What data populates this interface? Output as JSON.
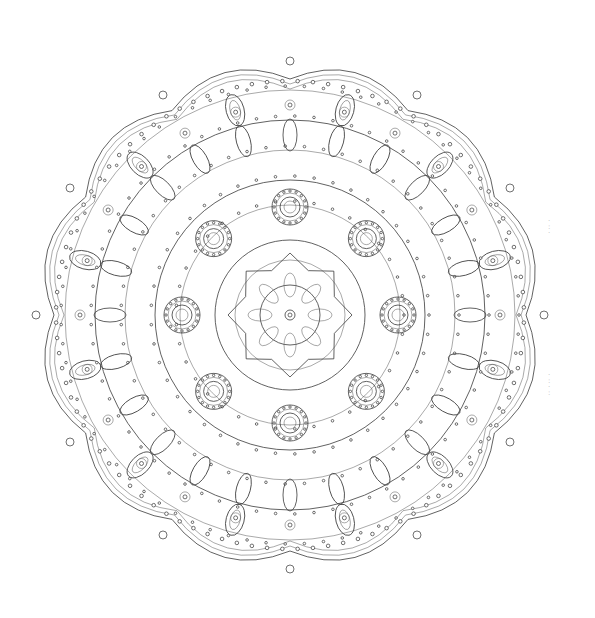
{
  "image": {
    "subject": "mandala line-art coloring page",
    "background": "#ffffff",
    "stroke_color": "#3a3a3a",
    "center": [
      290,
      315
    ],
    "outer_radius": 262,
    "petal_count": 12,
    "ring_radii": [
      30,
      55,
      75,
      110,
      135,
      165,
      195,
      225
    ],
    "medallion_count": 8,
    "medallion_radius": 108
  }
}
